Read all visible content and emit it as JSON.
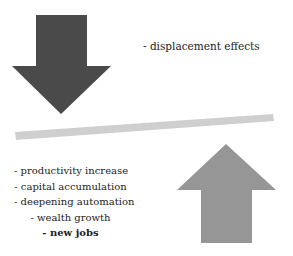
{
  "diagram": {
    "down_arrow": {
      "color": "#4a4a4a",
      "meaning": "displacement"
    },
    "up_arrow": {
      "color": "#969696",
      "meaning": "countervailing"
    },
    "balance_bar": {
      "color": "#cfcfcf"
    },
    "displacement_label": "- displacement effects",
    "countervailing_items": [
      {
        "text": "- productivity increase",
        "bold": false
      },
      {
        "text": "- capital accumulation",
        "bold": false
      },
      {
        "text": "- deepening automation",
        "bold": false
      },
      {
        "text": "- wealth growth",
        "bold": false
      },
      {
        "text": "- new jobs",
        "bold": true
      }
    ]
  }
}
